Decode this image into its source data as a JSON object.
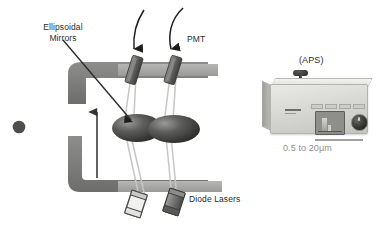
{
  "figure": {
    "type": "scientific-schematic"
  },
  "diagram": {
    "labels": {
      "ellipsoidal_mirrors": "Ellipsoidal\nMirrors",
      "ellipsoidal_mirrors_line1": "Ellipsoidal",
      "ellipsoidal_mirrors_line2": "Mirrors",
      "pmt": "PMT",
      "diode_lasers": "Diode Lasers"
    },
    "elements": {
      "particle_icon": "particle-dot",
      "mirror_count": 2,
      "pmt_count": 2,
      "laser_count": 2,
      "flow_arrow": "upward-flow-arrow",
      "signal_arrows": "two-curved-down-arrows"
    },
    "colors": {
      "duct_gray": "#7a7a78",
      "bar_gray": "#a8a8a6",
      "mirror_dark": "#3d3d3c",
      "beam_gray": "#c9c9c7",
      "text": "#2b2b2b",
      "detector_gray": "#6e6e6c"
    }
  },
  "instrument": {
    "label": "(APS)",
    "size_range": "0.5 to 20μm",
    "parts": {
      "probe": "inlet-probe",
      "display": "display-screen",
      "knob": "rotary-knob",
      "buttons": "front-panel-buttons",
      "logo": "brand-logo"
    },
    "colors": {
      "case": "#d8d8d4",
      "screen": "#8e8e8a",
      "knob": "#343432",
      "caption_text": "#8f8f8b"
    }
  }
}
